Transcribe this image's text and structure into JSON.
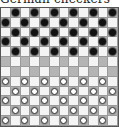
{
  "title": "German checkers",
  "board": {
    "rows": 12,
    "cols": 12,
    "dark_square_color": "#d8d8d8",
    "light_square_color": "#f4f4f4",
    "black_piece_color": "#111111",
    "white_piece_color": "#ffffff",
    "black_rows": [
      1,
      2,
      3,
      4,
      5
    ],
    "empty_rows": [
      6,
      7
    ],
    "white_rows": [
      8,
      9,
      10,
      11,
      12
    ],
    "dark_square_rule": "row odd -> even columns; row even -> odd columns"
  }
}
